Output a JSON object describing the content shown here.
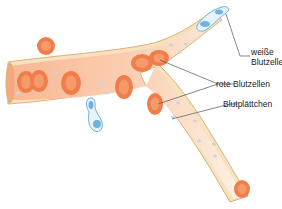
{
  "diagram": {
    "title": "",
    "labels": {
      "white_cell": [
        "weiße",
        "Blutzelle"
      ],
      "red_cells": "rote Blutzellen",
      "platelets": "Blutplättchen"
    },
    "colors": {
      "vessel_wall": "#f3dcb0",
      "vessel_outline": "#d9b27a",
      "plasma_rich": "#fbc7a7",
      "plasma_light": "#fdf0e0",
      "red_cell_outer": "#f07d4c",
      "red_cell_inner": "#f59a6a",
      "white_cell": "#6fb3dc",
      "platelet": "#c9d6e0",
      "leader": "#555555"
    }
  }
}
